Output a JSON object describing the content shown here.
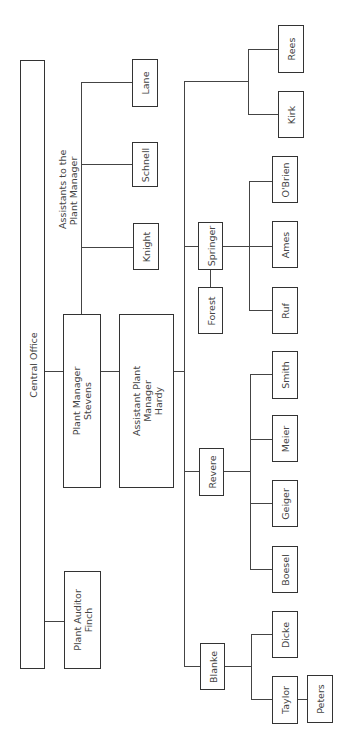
{
  "chart": {
    "orientation": "rotated -90deg",
    "central_office": "Central Office",
    "plant_auditor": {
      "title": "Plant Auditor",
      "name": "Finch"
    },
    "plant_manager": {
      "title": "Plant Manager",
      "name": "Stevens"
    },
    "assistant_plant_manager": {
      "title_line1": "Assistant Plant",
      "title_line2": "Manager",
      "name": "Hardy"
    },
    "assistants_label_line1": "Assistants to the",
    "assistants_label_line2": "Plant Manager",
    "assistants": [
      "Knight",
      "Schnell",
      "Lane"
    ],
    "departments": [
      {
        "head": "Blanke",
        "reports": [
          "Taylor",
          "Dicke"
        ],
        "sub": {
          "under": "Taylor",
          "name": "Peters"
        }
      },
      {
        "head": "Revere",
        "reports": [
          "Boesel",
          "Geiger",
          "Meier",
          "Smith"
        ]
      },
      {
        "head": "Springer",
        "deputy": "Forest",
        "reports": [
          "Ruf",
          "Ames",
          "O'Brien"
        ]
      },
      {
        "head": "",
        "reports": [
          "Kirk",
          "Rees"
        ]
      }
    ]
  }
}
